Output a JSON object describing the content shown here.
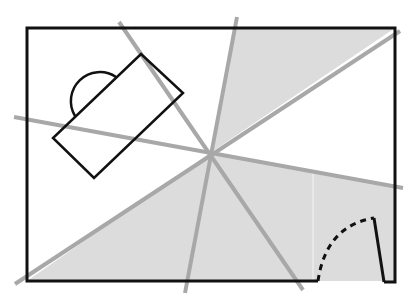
{
  "diagram": {
    "type": "floor-plan-visibility",
    "width": 408,
    "height": 304,
    "colors": {
      "background": "#ffffff",
      "wall": "#111111",
      "sight_line": "#a8a8a8",
      "shade": "#dcdcdc",
      "furniture": "#111111"
    },
    "room": {
      "walls": [
        [
          318,
          281
        ],
        [
          27,
          281
        ],
        [
          27,
          28
        ],
        [
          395,
          28
        ],
        [
          395,
          282
        ],
        [
          384,
          282
        ]
      ]
    },
    "door": {
      "leaf": [
        [
          384,
          282
        ],
        [
          374,
          218
        ]
      ],
      "swing_arc_start": [
        318,
        281
      ],
      "swing_arc_end": [
        374,
        218
      ]
    },
    "viewpoint": [
      210,
      153
    ],
    "sight_lines": [
      [
        [
          119,
          22
        ],
        [
          303,
          290
        ]
      ],
      [
        [
          237,
          17
        ],
        [
          185,
          293
        ]
      ],
      [
        [
          14,
          117
        ],
        [
          403,
          188
        ]
      ],
      [
        [
          400,
          31
        ],
        [
          15,
          284
        ]
      ]
    ],
    "shaded_regions": [
      [
        [
          210,
          153
        ],
        [
          234,
          28
        ],
        [
          395,
          28
        ]
      ],
      [
        [
          210,
          153
        ],
        [
          395,
          186
        ],
        [
          395,
          281
        ],
        [
          27,
          281
        ]
      ]
    ],
    "furniture": {
      "desk": [
        [
          141,
          54
        ],
        [
          183,
          93
        ],
        [
          94,
          178
        ],
        [
          53,
          138
        ]
      ],
      "chair_arc": {
        "start": [
          75,
          116
        ],
        "end": [
          116,
          77
        ]
      }
    }
  }
}
